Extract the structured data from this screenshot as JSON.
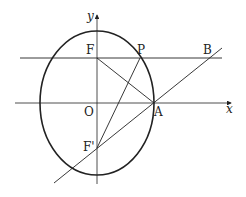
{
  "diagram": {
    "type": "ellipse-geometry",
    "axes": {
      "x_label": "x",
      "y_label": "y"
    },
    "points": {
      "origin": "O",
      "focus_top": "F",
      "focus_bottom": "F'",
      "vertex_right": "A",
      "point_on_ellipse": "P",
      "point_b": "B"
    },
    "colors": {
      "stroke": "#222222",
      "background": "#ffffff"
    }
  }
}
